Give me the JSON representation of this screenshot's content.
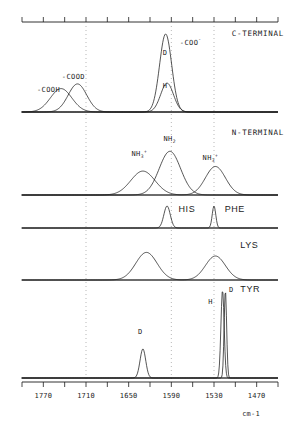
{
  "figure": {
    "units_label": "cm-1",
    "axis": {
      "ticks_labeled": [
        1770,
        1710,
        1650,
        1590,
        1530,
        1470
      ],
      "tick_label_strings": [
        "1770",
        "1710",
        "1650",
        "1590",
        "1530",
        "1470"
      ],
      "x_min_cm1": 1800,
      "x_max_cm1": 1440,
      "minor_tick_step_cm1": 30,
      "direction": "decreasing-left-to-right"
    },
    "guide_lines_cm1": [
      1710,
      1590,
      1530
    ]
  },
  "panels": [
    {
      "id": "c-terminal",
      "title": "C-TERMINAL",
      "annotations": [
        {
          "name": "cooh-label",
          "text": "-COOH",
          "x_cm1": 1762,
          "kind": "band"
        },
        {
          "name": "cood-label",
          "text": "-COOD",
          "x_cm1": 1727,
          "kind": "band"
        },
        {
          "name": "coo-minus-label",
          "text": "-COO",
          "sup": "-",
          "x_cm1": 1584,
          "kind": "band"
        },
        {
          "name": "coo-d-peak-label",
          "text": "D",
          "x_cm1": 1600,
          "kind": "peak"
        },
        {
          "name": "coo-h-peak-label",
          "text": "H",
          "x_cm1": 1600,
          "kind": "peak"
        }
      ],
      "curves": [
        {
          "name": "cooh-curve",
          "center_cm1": 1745,
          "width_cm1": 30,
          "height": 0.3
        },
        {
          "name": "cood-curve",
          "center_cm1": 1722,
          "width_cm1": 26,
          "height": 0.36
        },
        {
          "name": "coo-d-curve",
          "center_cm1": 1598,
          "width_cm1": 17,
          "height": 1.0
        },
        {
          "name": "coo-h-curve",
          "center_cm1": 1596,
          "width_cm1": 18,
          "height": 0.37
        }
      ]
    },
    {
      "id": "n-terminal",
      "title": "N-TERMINAL",
      "annotations": [
        {
          "name": "nh3-plus-left-label",
          "text": "NH",
          "sub": "3",
          "sup": "+",
          "x_cm1": 1633
        },
        {
          "name": "nh2-label",
          "text": "NH",
          "sub": "2",
          "x_cm1": 1588
        },
        {
          "name": "nh3-plus-right-label",
          "text": "NH",
          "sub": "3",
          "sup": "+",
          "x_cm1": 1532
        }
      ],
      "curves": [
        {
          "name": "nh3-plus-left-curve",
          "center_cm1": 1630,
          "width_cm1": 34,
          "height": 0.52
        },
        {
          "name": "nh2-curve",
          "center_cm1": 1592,
          "width_cm1": 30,
          "height": 0.95
        },
        {
          "name": "nh3-plus-right-curve",
          "center_cm1": 1528,
          "width_cm1": 28,
          "height": 0.62
        }
      ]
    },
    {
      "id": "his-phe",
      "titles": [
        "HIS",
        "PHE"
      ],
      "curves": [
        {
          "name": "his-curve",
          "center_cm1": 1596,
          "width_cm1": 9,
          "height": 1.0,
          "label": "HIS"
        },
        {
          "name": "phe-curve",
          "center_cm1": 1530,
          "width_cm1": 5,
          "height": 1.0,
          "label": "PHE"
        }
      ]
    },
    {
      "id": "lys",
      "title": "LYS",
      "curves": [
        {
          "name": "lys-peak-1",
          "center_cm1": 1625,
          "width_cm1": 30,
          "height": 0.92
        },
        {
          "name": "lys-peak-2",
          "center_cm1": 1528,
          "width_cm1": 28,
          "height": 0.8
        }
      ]
    },
    {
      "id": "tyr",
      "title": "TYR",
      "annotations": [
        {
          "name": "tyr-d-label-upper",
          "text": "D",
          "x_cm1": 1512
        },
        {
          "name": "tyr-h-label-upper",
          "text": "H",
          "x_cm1": 1535
        },
        {
          "name": "tyr-d-label-lower",
          "text": "D",
          "x_cm1": 1634
        }
      ],
      "curves": [
        {
          "name": "tyr-d-band",
          "center_cm1": 1630,
          "width_cm1": 8,
          "height": 0.33
        },
        {
          "name": "tyr-h-sharp",
          "center_cm1": 1518,
          "width_cm1": 4.5,
          "height": 1.0
        },
        {
          "name": "tyr-d-sharp",
          "center_cm1": 1514,
          "width_cm1": 3.5,
          "height": 1.0
        }
      ]
    }
  ],
  "colors": {
    "line": "#1c1c1c",
    "guide": "#9a9a9a",
    "background": "#ffffff"
  }
}
